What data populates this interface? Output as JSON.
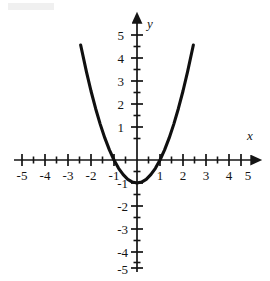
{
  "figure": {
    "background_color": "#ffffff",
    "ink_color": "#141414",
    "curve_color": "#101010",
    "axis_color": "#141414"
  },
  "axes": {
    "x_axis_name": "x",
    "y_axis_name": "y",
    "x_labels": [
      "-5",
      "-4",
      "-3",
      "-2",
      "-1",
      "1",
      "2",
      "3",
      "4",
      "5"
    ],
    "y_labels": [
      "5",
      "4",
      "3",
      "2",
      "1",
      "-1",
      "-2",
      "-3",
      "-4",
      "-5"
    ]
  },
  "chart_data": {
    "type": "line",
    "title": "",
    "subtitle": "",
    "xlabel": "x",
    "ylabel": "y",
    "xlim": [
      -5.5,
      5.5
    ],
    "ylim": [
      -5.5,
      5.7
    ],
    "grid": false,
    "legend": "none",
    "x_ticks": [
      -5,
      -4,
      -3,
      -2,
      -1,
      0,
      1,
      2,
      3,
      4,
      5
    ],
    "x_tick_labels": [
      "-5",
      "-4",
      "-3",
      "-2",
      "-1",
      "",
      "1",
      "2",
      "3",
      "4",
      "5"
    ],
    "x_minor_ticks": [
      -4.5,
      -3.5,
      -2.5,
      -1.5,
      -0.5,
      0.5,
      1.5,
      2.5,
      3.5,
      4.5
    ],
    "y_ticks": [
      -5,
      -4,
      -3,
      -2,
      -1,
      0,
      1,
      2,
      3,
      4,
      5
    ],
    "y_tick_labels": [
      "-5",
      "-4",
      "-3",
      "-2",
      "-1",
      "",
      "1",
      "2",
      "3",
      "4",
      "5"
    ],
    "y_minor_ticks": [
      -4.5,
      -3.5,
      -2.5,
      -1.5,
      -0.5,
      0.5,
      1.5,
      2.5,
      3.5,
      4.5
    ],
    "series": [
      {
        "name": "y = x^2 - 1",
        "equation": "y = x^2 - 1",
        "vertex": [
          0,
          -1
        ],
        "roots": [
          -1,
          1
        ],
        "x": [
          -2.45,
          -2.2,
          -2.0,
          -1.8,
          -1.6,
          -1.4,
          -1.2,
          -1.0,
          -0.8,
          -0.6,
          -0.4,
          -0.2,
          0,
          0.2,
          0.4,
          0.6,
          0.8,
          1.0,
          1.2,
          1.4,
          1.6,
          1.8,
          2.0,
          2.2,
          2.45
        ],
        "values": [
          5.0,
          3.84,
          3.0,
          2.24,
          1.56,
          0.96,
          0.44,
          0.0,
          -0.36,
          -0.64,
          -0.84,
          -0.96,
          -1.0,
          -0.96,
          -0.84,
          -0.64,
          -0.36,
          0.0,
          0.44,
          0.96,
          1.56,
          2.24,
          3.0,
          3.84,
          5.0
        ]
      }
    ]
  }
}
